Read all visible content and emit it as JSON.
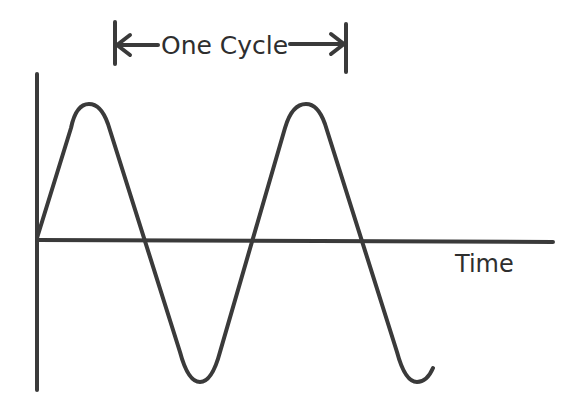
{
  "diagram": {
    "cycle_label": "One Cycle",
    "x_axis_label": "Time",
    "colors": {
      "stroke": "#3a3a3a",
      "background": "#ffffff"
    },
    "elements": {
      "vertical_axis": "amplitude-axis",
      "horizontal_axis": "time-axis",
      "waveform": "sine-wave",
      "cycle_marker": "double-arrow-with-end-bars"
    }
  }
}
